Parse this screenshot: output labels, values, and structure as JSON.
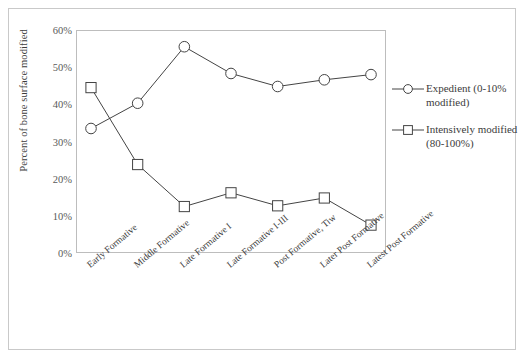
{
  "chart_data": {
    "type": "line",
    "title": "",
    "xlabel": "",
    "ylabel": "Percent of bone surface modified",
    "categories": [
      "Early Formative",
      "Middle Formative",
      "Late Formative I",
      "Late Formative I-III",
      "Post Formative, Tiw",
      "Later Post Formative",
      "Latest Post Formative"
    ],
    "series": [
      {
        "name": "Expedient (0-10% modified)",
        "marker": "circle",
        "values": [
          33.5,
          40.3,
          55.5,
          48.3,
          44.8,
          46.6,
          48.0
        ]
      },
      {
        "name": "Intensively modified (80-100%)",
        "marker": "square",
        "values": [
          44.5,
          23.8,
          12.5,
          16.2,
          12.7,
          14.8,
          7.5
        ]
      }
    ],
    "ylim": [
      0,
      60
    ],
    "ytick_step": 10,
    "ytick_labels": [
      "0%",
      "10%",
      "20%",
      "30%",
      "40%",
      "50%",
      "60%"
    ],
    "grid": false,
    "legend_position": "right",
    "line_color": "#444444",
    "marker_fill": "#ffffff",
    "frame_color": "#bdbdbd"
  },
  "legend": {
    "entries": [
      {
        "label": "Expedient (0-10% modified)",
        "marker": "circle"
      },
      {
        "label": "Intensively modified (80-100%)",
        "marker": "square"
      }
    ]
  }
}
